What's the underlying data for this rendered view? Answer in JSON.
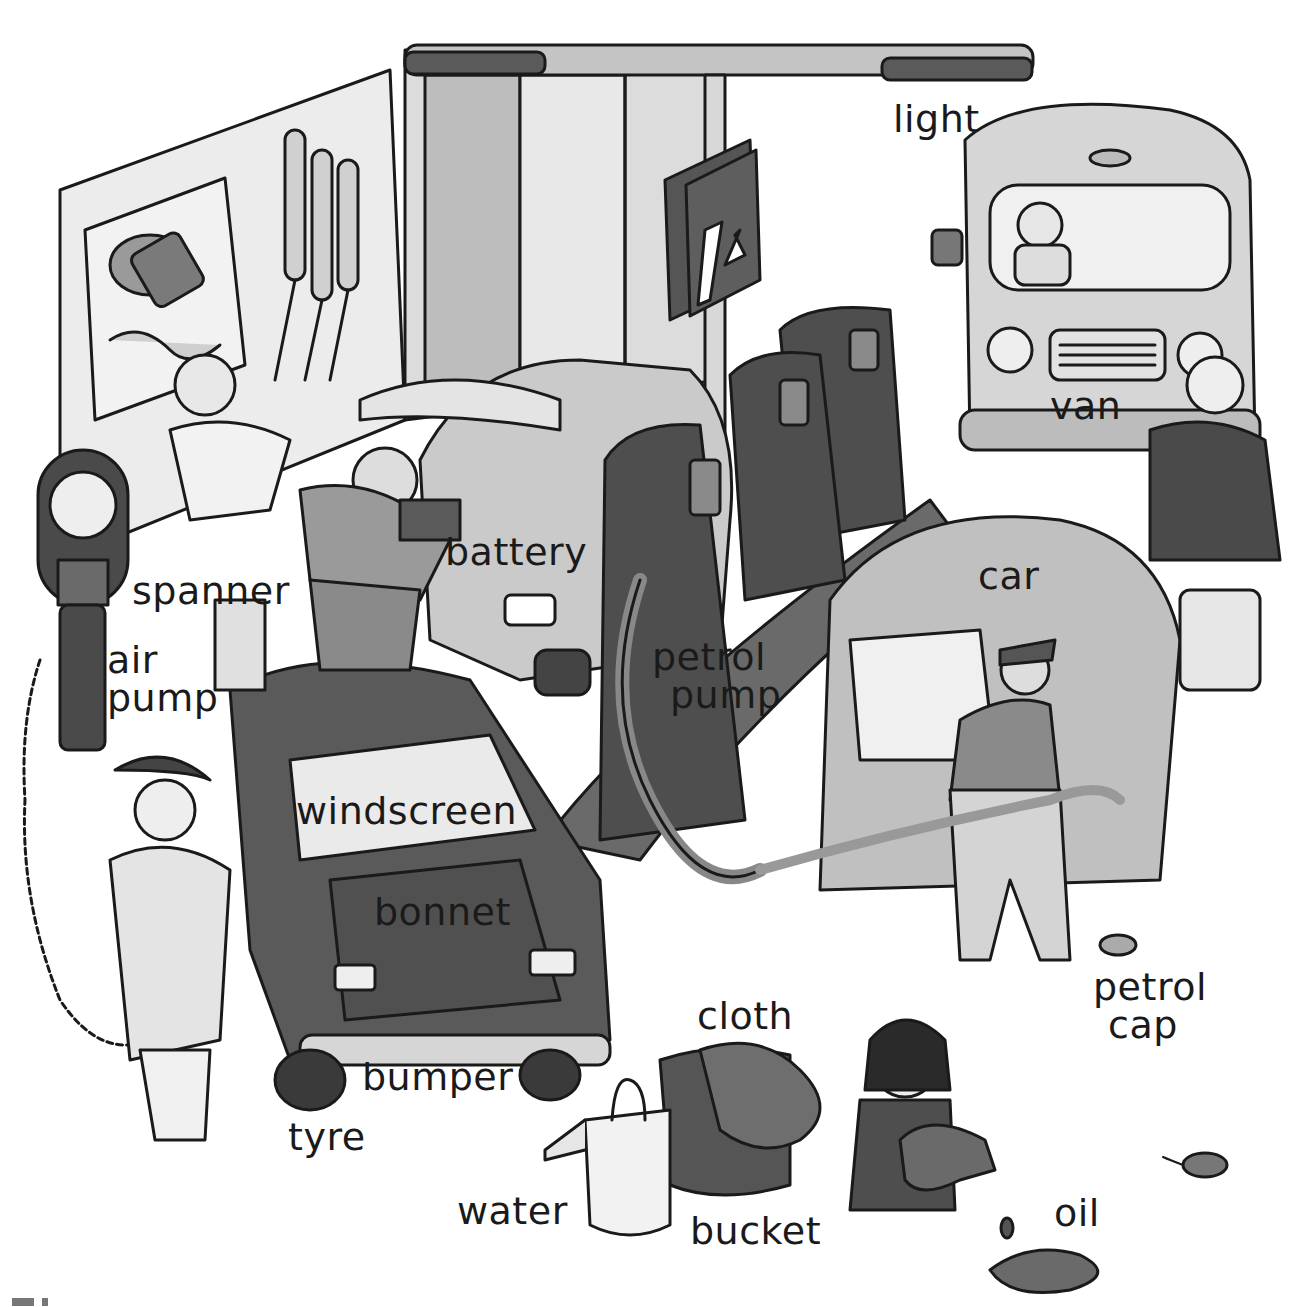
{
  "scene": {
    "title": "Petrol station picture dictionary",
    "labels": [
      {
        "id": "light",
        "text": "light",
        "x": 893,
        "y": 100
      },
      {
        "id": "van",
        "text": "van",
        "x": 1050,
        "y": 387
      },
      {
        "id": "battery",
        "text": "battery",
        "x": 445,
        "y": 533
      },
      {
        "id": "spanner",
        "text": "spanner",
        "x": 132,
        "y": 572
      },
      {
        "id": "car",
        "text": "car",
        "x": 978,
        "y": 557
      },
      {
        "id": "air-pump",
        "lines": [
          "air",
          "pump"
        ],
        "x": 107,
        "y": 641
      },
      {
        "id": "petrol-pump",
        "lines": [
          "petrol",
          "pump"
        ],
        "x": 652,
        "y": 638
      },
      {
        "id": "windscreen",
        "text": "windscreen",
        "x": 296,
        "y": 792
      },
      {
        "id": "bonnet",
        "text": "bonnet",
        "x": 374,
        "y": 893
      },
      {
        "id": "petrol-cap",
        "lines": [
          "petrol",
          "cap"
        ],
        "x": 1093,
        "y": 968
      },
      {
        "id": "cloth",
        "text": "cloth",
        "x": 697,
        "y": 997
      },
      {
        "id": "bumper",
        "text": "bumper",
        "x": 362,
        "y": 1058
      },
      {
        "id": "tyre",
        "text": "tyre",
        "x": 288,
        "y": 1118
      },
      {
        "id": "water",
        "text": "water",
        "x": 457,
        "y": 1192
      },
      {
        "id": "oil",
        "text": "oil",
        "x": 1054,
        "y": 1194
      },
      {
        "id": "bucket",
        "text": "bucket",
        "x": 690,
        "y": 1212
      }
    ],
    "sign": {
      "arrow_glyph": "↙"
    },
    "colors": {
      "ink": "#1a1a1a",
      "dark": "#4a4a4a",
      "mid": "#8a8a8a",
      "light": "#c8c8c8",
      "pale": "#e6e6e6"
    }
  }
}
